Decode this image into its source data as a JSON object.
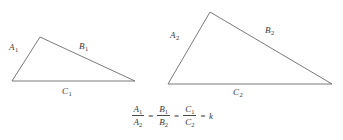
{
  "figure": {
    "background_color": "#ffffff",
    "stroke_color": "#6b6b6b",
    "text_color": "#3a3a3a"
  },
  "triangles": [
    {
      "name": "triangle-1",
      "vertices": [
        [
          12,
          81
        ],
        [
          40,
          37
        ],
        [
          135,
          81
        ]
      ],
      "labels": {
        "side_a": "A",
        "side_a_sub": "1",
        "side_b": "B",
        "side_b_sub": "1",
        "side_c": "C",
        "side_c_sub": "1"
      },
      "label_positions": {
        "a": [
          9,
          43
        ],
        "b": [
          79,
          42
        ],
        "c": [
          62,
          87
        ]
      }
    },
    {
      "name": "triangle-2",
      "vertices": [
        [
          168,
          84
        ],
        [
          210,
          12
        ],
        [
          332,
          84
        ]
      ],
      "labels": {
        "side_a": "A",
        "side_a_sub": "2",
        "side_b": "B",
        "side_b_sub": "2",
        "side_c": "C",
        "side_c_sub": "2"
      },
      "label_positions": {
        "a": [
          170,
          31
        ],
        "b": [
          265,
          26
        ],
        "c": [
          233,
          88
        ]
      }
    }
  ],
  "equation": {
    "terms": [
      {
        "numerator": "A",
        "numerator_sub": "1",
        "denominator": "A",
        "denominator_sub": "2"
      },
      {
        "numerator": "B",
        "numerator_sub": "1",
        "denominator": "B",
        "denominator_sub": "2"
      },
      {
        "numerator": "C",
        "numerator_sub": "1",
        "denominator": "C",
        "denominator_sub": "2"
      }
    ],
    "operator": "=",
    "result": "k",
    "plain_text": "A1/A2 = B1/B2 = C1/C2 = k"
  }
}
